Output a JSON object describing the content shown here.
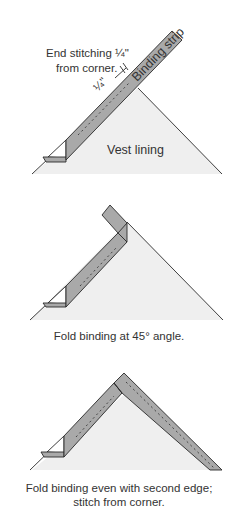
{
  "panels": [
    {
      "id": "step-1",
      "labels": {
        "instruction_line1": "End stitching ¼\"",
        "instruction_line2": "from corner.",
        "strip_label": "Binding strip",
        "lining_label": "Vest lining",
        "measure_label": "¼\""
      }
    },
    {
      "id": "step-2",
      "caption": "Fold binding at 45° angle."
    },
    {
      "id": "step-3",
      "caption_line1": "Fold binding even with second edge;",
      "caption_line2": "stitch from corner."
    }
  ],
  "colors": {
    "strip": "#a9a9a9",
    "lining": "#efefef",
    "outline": "#2a2a2a",
    "text": "#333333"
  }
}
